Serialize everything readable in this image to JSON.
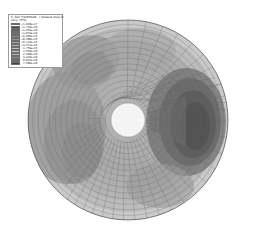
{
  "app": {
    "kind": "fea-contour-viewport",
    "background_color": "#ffffff"
  },
  "legend": {
    "title": "S, S22 (*AVERAGE...) (Default style-1)",
    "average_line": "(Avg: 75%)",
    "border_color": "#9a9a9a",
    "entries": [
      {
        "label": "+1.018e+17",
        "color": "#3a3a3a"
      },
      {
        "label": "+1.729e+16",
        "color": "#4d4d4d"
      },
      {
        "label": "+1.254e+16",
        "color": "#606060"
      },
      {
        "label": "+1.079e+16",
        "color": "#737373"
      },
      {
        "label": "+9.205e+15",
        "color": "#848484"
      },
      {
        "label": "+8.386e+15",
        "color": "#949494"
      },
      {
        "label": "+6.113e+15",
        "color": "#a3a3a3"
      },
      {
        "label": "+4.371e+15",
        "color": "#b1b1b1"
      },
      {
        "label": "-1.759e+15",
        "color": "#bebebe"
      },
      {
        "label": "-1.533e+16",
        "color": "#c9c9c9"
      },
      {
        "label": "-2.428e+16",
        "color": "#b4b4b4"
      },
      {
        "label": "-4.442e+16",
        "color": "#8e8e8e"
      },
      {
        "label": "-6.024e+16",
        "color": "#686868"
      },
      {
        "label": "-7.586e+16",
        "color": "#3f3f3f"
      }
    ]
  },
  "chart_data": {
    "type": "heatmap",
    "title": "S, S22 (*AVERAGE...) (Default style-1)",
    "subtitle": "(Avg: 75%)",
    "geometry": "annular-disk",
    "mesh": {
      "radial_divisions": 18,
      "circumferential_divisions": 72,
      "outer_radius_px": 100,
      "inner_radius_px": 17,
      "center_px": [
        128,
        120
      ],
      "grid": true,
      "grid_color": "#5a5a5a"
    },
    "colormap": "grayscale",
    "legend_position": "top-left",
    "contour_bands": [
      {
        "name": "outer-rim-light",
        "value": -1759000000000000.0,
        "color": "#c4c4c4"
      },
      {
        "name": "mid-annulus-mid",
        "value": 4371000000000000.0,
        "color": "#aeaeae"
      },
      {
        "name": "upper-left-lobe",
        "value": 6113000000000000.0,
        "color": "#9d9d9d"
      },
      {
        "name": "left-band",
        "value": 8386000000000000.0,
        "color": "#8e8e8e"
      },
      {
        "name": "lower-left-band",
        "value": 9205000000000000.0,
        "color": "#8a8a8a"
      },
      {
        "name": "right-lobe-dark",
        "value": -6.024e+16,
        "color": "#6a6a6a"
      },
      {
        "name": "right-lobe-core",
        "value": -7.586e+16,
        "color": "#555555"
      },
      {
        "name": "hole-interior",
        "value": null,
        "color": "#f4f4f4"
      }
    ],
    "xlabel": "",
    "ylabel": ""
  }
}
